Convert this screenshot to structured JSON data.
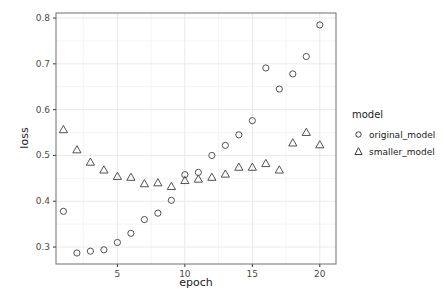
{
  "figure": {
    "background": "#ffffff"
  },
  "style": {
    "marker_color": "#404040",
    "panel_border": "#6f6f6f",
    "grid_major": "#e9e9e9",
    "grid_minor": "#f4f4f4",
    "tick_color": "#333333",
    "tick_label_color": "#4d4d4d",
    "text_color": "#1a1a1a"
  },
  "legend": {
    "title": "model",
    "items": [
      {
        "label": "original_model",
        "marker": "circle"
      },
      {
        "label": "smaller_model",
        "marker": "triangle"
      }
    ]
  },
  "chart_data": {
    "type": "scatter",
    "title": "",
    "xlabel": "epoch",
    "ylabel": "loss",
    "legend_title": "model",
    "legend_position": "right",
    "grid": true,
    "xlim": [
      0.45,
      21.2
    ],
    "ylim": [
      0.263,
      0.811
    ],
    "x_ticks": [
      5,
      10,
      15,
      20
    ],
    "x_tick_labels": [
      "5",
      "10",
      "15",
      "20"
    ],
    "y_ticks": [
      0.3,
      0.4,
      0.5,
      0.6,
      0.7,
      0.8
    ],
    "y_tick_labels": [
      "0.3",
      "0.4",
      "0.5",
      "0.6",
      "0.7",
      "0.8"
    ],
    "x": [
      1,
      2,
      3,
      4,
      5,
      6,
      7,
      8,
      9,
      10,
      11,
      12,
      13,
      14,
      15,
      16,
      17,
      18,
      19,
      20
    ],
    "series": [
      {
        "name": "original_model",
        "marker": "circle",
        "values": [
          0.378,
          0.287,
          0.291,
          0.294,
          0.31,
          0.33,
          0.36,
          0.374,
          0.402,
          0.458,
          0.463,
          0.5,
          0.522,
          0.545,
          0.576,
          0.691,
          0.645,
          0.678,
          0.716,
          0.785
        ]
      },
      {
        "name": "smaller_model",
        "marker": "triangle",
        "values": [
          0.556,
          0.512,
          0.485,
          0.468,
          0.454,
          0.452,
          0.438,
          0.44,
          0.432,
          0.445,
          0.448,
          0.452,
          0.459,
          0.474,
          0.474,
          0.482,
          0.468,
          0.527,
          0.55,
          0.523
        ]
      }
    ]
  }
}
